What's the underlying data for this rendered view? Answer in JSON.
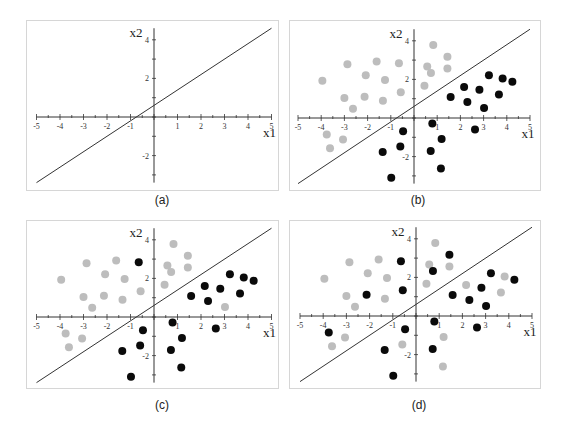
{
  "figure": {
    "captions": [
      "(a)",
      "(b)",
      "(c)",
      "(d)"
    ]
  },
  "colors": {
    "class_pos": "#bdbdbd",
    "class_neg": "#0a0a0a",
    "line": "#333333",
    "axis": "#333333",
    "frame": "#d6d6d6"
  },
  "chart_data": [
    {
      "type": "scatter",
      "panel": "(a)",
      "title": "",
      "xlabel": "x1",
      "ylabel": "x2",
      "xlim": [
        -5,
        5
      ],
      "ylim": [
        -3.5,
        4.5
      ],
      "xticks": [
        -5,
        -4,
        -3,
        -2,
        -1,
        1,
        2,
        3,
        4,
        5
      ],
      "yticks": [
        4,
        2,
        -2
      ],
      "grid": false,
      "line": {
        "slope": 0.8,
        "intercept": 0.6,
        "x": [
          -5,
          5
        ]
      },
      "series": []
    },
    {
      "type": "scatter",
      "panel": "(b)",
      "xlabel": "x1",
      "ylabel": "x2",
      "xlim": [
        -5,
        5
      ],
      "ylim": [
        -3.5,
        4.5
      ],
      "xticks": [
        -5,
        -4,
        -3,
        -2,
        -1,
        1,
        2,
        3,
        4,
        5
      ],
      "yticks": [
        4,
        2,
        -2
      ],
      "grid": false,
      "line": {
        "slope": 0.8,
        "intercept": 0.6,
        "x": [
          -5,
          5
        ]
      },
      "series": [
        {
          "name": "gray",
          "points": [
            [
              -3.95,
              1.93
            ],
            [
              -2.87,
              2.79
            ],
            [
              -1.61,
              2.93
            ],
            [
              -0.65,
              2.84
            ],
            [
              0.83,
              3.78
            ],
            [
              1.44,
              3.17
            ],
            [
              -2.08,
              2.21
            ],
            [
              -1.25,
              1.97
            ],
            [
              0.57,
              2.67
            ],
            [
              0.73,
              2.33
            ],
            [
              1.44,
              2.57
            ],
            [
              0.45,
              1.67
            ],
            [
              -0.57,
              1.34
            ],
            [
              -3.0,
              1.03
            ],
            [
              -2.13,
              1.1
            ],
            [
              -1.34,
              0.9
            ],
            [
              -2.63,
              0.48
            ],
            [
              -3.76,
              -0.86
            ],
            [
              -3.06,
              -1.12
            ],
            [
              -3.62,
              -1.57
            ]
          ]
        },
        {
          "name": "black",
          "points": [
            [
              3.23,
              2.21
            ],
            [
              3.82,
              2.05
            ],
            [
              4.24,
              1.88
            ],
            [
              2.16,
              1.6
            ],
            [
              2.82,
              1.47
            ],
            [
              3.66,
              1.22
            ],
            [
              1.58,
              1.09
            ],
            [
              2.3,
              0.83
            ],
            [
              3.02,
              0.52
            ],
            [
              0.79,
              -0.28
            ],
            [
              2.63,
              -0.59
            ],
            [
              -0.47,
              -0.69
            ],
            [
              1.19,
              -1.09
            ],
            [
              -0.59,
              -1.48
            ],
            [
              -1.35,
              -1.76
            ],
            [
              0.72,
              -1.71
            ],
            [
              1.16,
              -2.62
            ],
            [
              -0.98,
              -3.1
            ]
          ]
        }
      ]
    },
    {
      "type": "scatter",
      "panel": "(c)",
      "xlabel": "x1",
      "ylabel": "x2",
      "xlim": [
        -5,
        5
      ],
      "ylim": [
        -3.5,
        4.5
      ],
      "xticks": [
        -5,
        -4,
        -3,
        -2,
        -1,
        1,
        2,
        3,
        4,
        5
      ],
      "yticks": [
        4,
        2,
        -2
      ],
      "grid": false,
      "line": {
        "slope": 0.8,
        "intercept": 0.6,
        "x": [
          -5,
          5
        ]
      },
      "series": [
        {
          "name": "gray",
          "points": [
            [
              -3.95,
              1.93
            ],
            [
              -2.87,
              2.79
            ],
            [
              -1.61,
              2.93
            ],
            [
              0.83,
              3.78
            ],
            [
              1.44,
              3.17
            ],
            [
              -2.08,
              2.21
            ],
            [
              -1.25,
              1.97
            ],
            [
              0.57,
              2.67
            ],
            [
              0.73,
              2.33
            ],
            [
              1.44,
              2.57
            ],
            [
              0.45,
              1.67
            ],
            [
              -0.57,
              1.34
            ],
            [
              -3.0,
              1.03
            ],
            [
              -2.13,
              1.1
            ],
            [
              -1.34,
              0.9
            ],
            [
              -2.63,
              0.48
            ],
            [
              -3.76,
              -0.86
            ],
            [
              -3.06,
              -1.12
            ],
            [
              -3.62,
              -1.57
            ],
            [
              3.02,
              0.52
            ]
          ]
        },
        {
          "name": "black",
          "points": [
            [
              -0.65,
              2.84
            ],
            [
              3.23,
              2.21
            ],
            [
              3.82,
              2.05
            ],
            [
              4.24,
              1.88
            ],
            [
              2.16,
              1.6
            ],
            [
              2.82,
              1.47
            ],
            [
              3.66,
              1.22
            ],
            [
              1.58,
              1.09
            ],
            [
              2.3,
              0.83
            ],
            [
              0.79,
              -0.28
            ],
            [
              2.63,
              -0.59
            ],
            [
              -0.47,
              -0.69
            ],
            [
              1.19,
              -1.09
            ],
            [
              -0.59,
              -1.48
            ],
            [
              -1.35,
              -1.76
            ],
            [
              0.72,
              -1.71
            ],
            [
              1.16,
              -2.62
            ],
            [
              -0.98,
              -3.1
            ]
          ]
        }
      ]
    },
    {
      "type": "scatter",
      "panel": "(d)",
      "xlabel": "x1",
      "ylabel": "x2",
      "xlim": [
        -5,
        5
      ],
      "ylim": [
        -3.5,
        4.5
      ],
      "xticks": [
        -5,
        -4,
        -3,
        -2,
        -1,
        1,
        2,
        3,
        4,
        5
      ],
      "yticks": [
        4,
        2,
        -2
      ],
      "grid": false,
      "line": {
        "slope": 0.8,
        "intercept": 0.6,
        "x": [
          -5,
          5
        ]
      },
      "series": [
        {
          "name": "gray",
          "points": [
            [
              -3.95,
              1.93
            ],
            [
              -2.87,
              2.79
            ],
            [
              -1.61,
              2.93
            ],
            [
              0.83,
              3.78
            ],
            [
              -2.08,
              2.21
            ],
            [
              -1.25,
              1.97
            ],
            [
              0.57,
              2.67
            ],
            [
              1.44,
              2.57
            ],
            [
              0.45,
              1.67
            ],
            [
              -3.0,
              1.03
            ],
            [
              -1.34,
              0.9
            ],
            [
              -2.63,
              0.48
            ],
            [
              -3.06,
              -1.12
            ],
            [
              -3.62,
              -1.57
            ],
            [
              2.16,
              1.6
            ],
            [
              3.82,
              2.05
            ],
            [
              3.66,
              1.22
            ],
            [
              -0.59,
              -1.48
            ],
            [
              1.19,
              -1.09
            ],
            [
              1.16,
              -2.62
            ]
          ]
        },
        {
          "name": "black",
          "points": [
            [
              -0.65,
              2.84
            ],
            [
              1.44,
              3.17
            ],
            [
              0.73,
              2.33
            ],
            [
              -0.57,
              1.34
            ],
            [
              -2.13,
              1.1
            ],
            [
              3.23,
              2.21
            ],
            [
              4.24,
              1.88
            ],
            [
              2.82,
              1.47
            ],
            [
              1.58,
              1.09
            ],
            [
              2.3,
              0.83
            ],
            [
              3.02,
              0.52
            ],
            [
              0.79,
              -0.28
            ],
            [
              2.63,
              -0.59
            ],
            [
              -0.47,
              -0.69
            ],
            [
              -3.76,
              -0.86
            ],
            [
              -1.35,
              -1.76
            ],
            [
              0.72,
              -1.71
            ],
            [
              -0.98,
              -3.1
            ]
          ]
        }
      ]
    }
  ]
}
